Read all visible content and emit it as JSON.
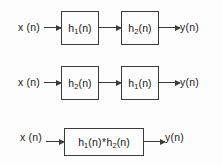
{
  "figure": {
    "background_color": "#fdfdfd",
    "line_color": "#3b3b3b",
    "text_color": "#151515"
  },
  "rows": [
    {
      "name": "cascade-h1-then-h2",
      "input_label": "x (n)",
      "output_label": "y(n)",
      "blocks": [
        {
          "base": "h",
          "sub": "1",
          "suffix": "(n)"
        },
        {
          "base": "h",
          "sub": "2",
          "suffix": "(n)"
        }
      ],
      "arrows": [
        "input-to-block1",
        "block1-to-block2",
        "block2-to-output"
      ]
    },
    {
      "name": "cascade-h2-then-h1",
      "input_label": "x (n)",
      "output_label": "y(n)",
      "blocks": [
        {
          "base": "h",
          "sub": "2",
          "suffix": "(n)"
        },
        {
          "base": "h",
          "sub": "1",
          "suffix": "(n)"
        }
      ],
      "arrows": [
        "input-to-block1",
        "block1-to-block2",
        "block2-to-output"
      ]
    },
    {
      "name": "combined-convolution",
      "input_label": "x (n)",
      "output_label": "y(n)",
      "operator": "*",
      "blocks": [
        {
          "base": "h",
          "sub": "1",
          "suffix": "(n)"
        },
        {
          "base": "h",
          "sub": "2",
          "suffix": "(n)"
        }
      ],
      "arrows": [
        "input-to-block",
        "block-to-output"
      ]
    }
  ]
}
